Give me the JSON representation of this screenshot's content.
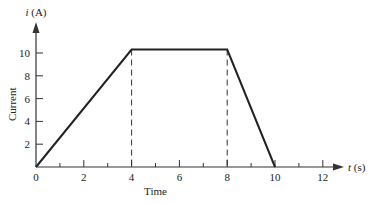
{
  "chart_data": {
    "type": "line",
    "title": "",
    "xlabel": "Time",
    "ylabel": "Current",
    "x_axis_symbol": "t",
    "x_axis_unit": "(s)",
    "y_axis_symbol": "i",
    "y_axis_unit": "(A)",
    "x": [
      0,
      4,
      8,
      10
    ],
    "series": [
      {
        "name": "i(t)",
        "values": [
          0,
          10.3,
          10.3,
          0
        ]
      }
    ],
    "x_ticks": [
      0,
      2,
      4,
      6,
      8,
      10,
      12
    ],
    "x_tick_labels": [
      "0",
      "2",
      "4",
      "6",
      "8",
      "10",
      "12"
    ],
    "x_minor_ticks": [
      1,
      3,
      5,
      7,
      9,
      11
    ],
    "y_ticks": [
      2,
      4,
      6,
      8,
      10
    ],
    "y_tick_labels": [
      "2",
      "4",
      "6",
      "8",
      "10"
    ],
    "xlim": [
      0,
      13
    ],
    "ylim": [
      0,
      12
    ],
    "grid": false,
    "annotations": [
      {
        "type": "dashed-vertical",
        "x": 4
      },
      {
        "type": "dashed-vertical",
        "x": 8
      }
    ],
    "line_color": "#222222"
  }
}
